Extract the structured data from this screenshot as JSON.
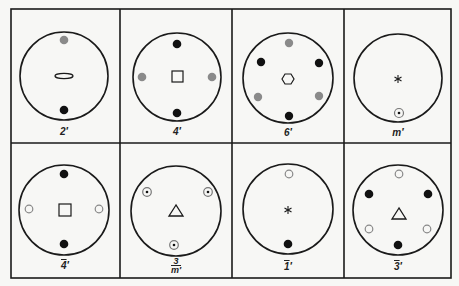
{
  "figure": {
    "legend": {
      "black_dot": "#111111",
      "gray_dot": "#8a8a8a",
      "open_circle": "#8a8a8a",
      "line": "#1a1a1a",
      "background": "#f7f7f5"
    },
    "cells": [
      {
        "id": "2p",
        "label": "2′",
        "label_main": "2′",
        "overline": false,
        "symbol": "lens-2fold",
        "row": 0,
        "col": 0
      },
      {
        "id": "4p",
        "label": "4′",
        "label_main": "4′",
        "overline": false,
        "symbol": "square-4fold",
        "row": 0,
        "col": 1
      },
      {
        "id": "6p",
        "label": "6′",
        "label_main": "6′",
        "overline": false,
        "symbol": "hexagon-6fold",
        "row": 0,
        "col": 2
      },
      {
        "id": "mp",
        "label": "m′",
        "label_main": "m′",
        "overline": false,
        "symbol": "asterisk",
        "row": 0,
        "col": 3
      },
      {
        "id": "4barp",
        "label": "4̄′",
        "label_main": "4",
        "suffix": "′",
        "overline": true,
        "symbol": "square-4fold",
        "row": 1,
        "col": 0
      },
      {
        "id": "3overmp",
        "label": "3/m′",
        "numerator": "3",
        "denominator": "m′",
        "overline": false,
        "symbol": "triangle-3fold",
        "row": 1,
        "col": 1
      },
      {
        "id": "1barp",
        "label": "1̄′",
        "label_main": "1",
        "suffix": "′",
        "overline": true,
        "symbol": "asterisk",
        "row": 1,
        "col": 2
      },
      {
        "id": "3barp",
        "label": "3̄′",
        "label_main": "3",
        "suffix": "′",
        "overline": true,
        "symbol": "triangle-3fold",
        "row": 1,
        "col": 3
      }
    ]
  },
  "labels": {
    "c0": "2′",
    "c1": "4′",
    "c2": "6′",
    "c3": "m′",
    "c4_main": "4",
    "c4_suffix": "′",
    "c5_num": "3",
    "c5_den": "m′",
    "c6_main": "1",
    "c6_suffix": "′",
    "c7_main": "3",
    "c7_suffix": "′"
  }
}
